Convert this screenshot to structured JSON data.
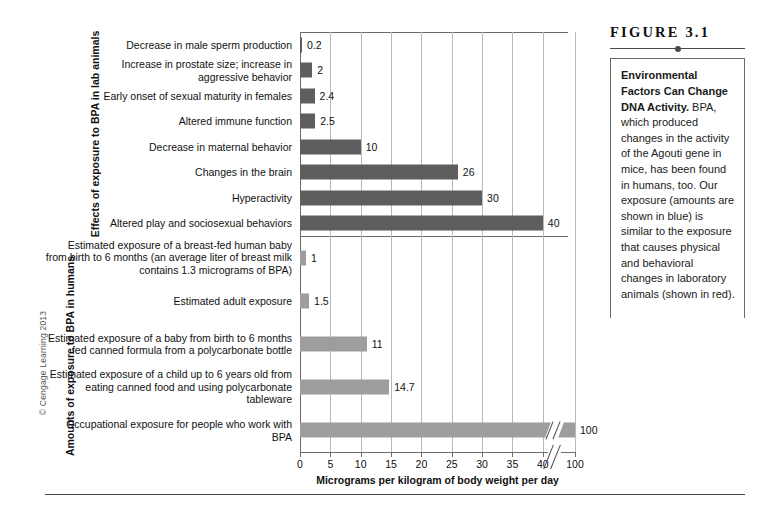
{
  "figure": {
    "number_label": "FIGURE 3.1",
    "caption_bold": "Environmental Factors Can Change DNA Activity.",
    "caption_body": " BPA, which produced changes in the activity of the Agouti gene in mice, has been found in humans, too. Our exposure (amounts are shown in blue) is similar to the exposure that causes physical and behavioral changes in laboratory animals (shown in red).",
    "copyright": "© Cengage Learning 2013"
  },
  "axis": {
    "x_title": "Micrograms per kilogram of body weight per day",
    "tick_labels": [
      "0",
      "5",
      "10",
      "15",
      "20",
      "25",
      "30",
      "35",
      "40",
      "100"
    ],
    "tick_values": [
      0,
      5,
      10,
      15,
      20,
      25,
      30,
      35,
      40,
      100
    ],
    "break_after": 40,
    "group_title_top": "Effects of exposure to BPA in lab animals",
    "group_title_bottom": "Amounts of exposure to BPA in humans"
  },
  "colors": {
    "bar_top": "#5e5e5e",
    "bar_bottom": "#9d9d9d",
    "bar_top_described": "red",
    "bar_bottom_described": "blue",
    "grid": "#b9b9b9",
    "axis": "#6b6b6b"
  },
  "chart_data": {
    "type": "bar",
    "orientation": "horizontal",
    "title": "Environmental Factors Can Change DNA Activity",
    "xlabel": "Micrograms per kilogram of body weight per day",
    "ylabel": "",
    "xlim": [
      0,
      100
    ],
    "axis_break": {
      "from": 42,
      "to": 100,
      "note": "axis broken between 40 and 100"
    },
    "xticks": [
      0,
      5,
      10,
      15,
      20,
      25,
      30,
      35,
      40,
      100
    ],
    "grid": true,
    "legend": "none",
    "series": [
      {
        "name": "Effects of exposure to BPA in lab animals",
        "color": "#5e5e5e",
        "described_color": "red",
        "categories": [
          "Decrease in male sperm production",
          "Increase in prostate size; increase in aggressive behavior",
          "Early onset of sexual maturity in females",
          "Altered immune function",
          "Decrease in maternal behavior",
          "Changes in the brain",
          "Hyperactivity",
          "Altered play and sociosexual behaviors"
        ],
        "values": [
          0.2,
          2,
          2.4,
          2.5,
          10,
          26,
          30,
          40
        ],
        "value_labels": [
          "0.2",
          "2",
          "2.4",
          "2.5",
          "10",
          "26",
          "30",
          "40"
        ]
      },
      {
        "name": "Amounts of exposure to BPA in humans",
        "color": "#9d9d9d",
        "described_color": "blue",
        "categories": [
          "Estimated exposure of a breast-fed human baby from birth to 6 months (an average liter of breast milk contains 1.3 micrograms of BPA)",
          "Estimated adult exposure",
          "Estimated exposure of a baby from birth to 6 months fed canned formula from a polycarbonate bottle",
          "Estimated exposure of a child up to 6 years old from eating canned food and using polycarbonate tableware",
          "Occupational exposure for people who work with BPA"
        ],
        "values": [
          1,
          1.5,
          11,
          14.7,
          100
        ],
        "value_labels": [
          "1",
          "1.5",
          "11",
          "14.7",
          "100"
        ]
      }
    ]
  },
  "rows_top": [
    {
      "label": "Decrease in male sperm production",
      "value": 0.2,
      "value_label": "0.2"
    },
    {
      "label": "Increase in prostate size; increase in aggressive behavior",
      "value": 2,
      "value_label": "2"
    },
    {
      "label": "Early onset of sexual maturity in females",
      "value": 2.4,
      "value_label": "2.4"
    },
    {
      "label": "Altered immune function",
      "value": 2.5,
      "value_label": "2.5"
    },
    {
      "label": "Decrease in maternal behavior",
      "value": 10,
      "value_label": "10"
    },
    {
      "label": "Changes in the brain",
      "value": 26,
      "value_label": "26"
    },
    {
      "label": "Hyperactivity",
      "value": 30,
      "value_label": "30"
    },
    {
      "label": "Altered play and sociosexual behaviors",
      "value": 40,
      "value_label": "40"
    }
  ],
  "rows_bottom": [
    {
      "label": "Estimated exposure of a breast-fed human baby from birth to 6 months (an average liter of breast milk contains 1.3 micrograms of BPA)",
      "value": 1,
      "value_label": "1"
    },
    {
      "label": "Estimated adult exposure",
      "value": 1.5,
      "value_label": "1.5"
    },
    {
      "label": "Estimated exposure of a baby from birth to 6 months fed canned formula from a polycarbonate bottle",
      "value": 11,
      "value_label": "11"
    },
    {
      "label": "Estimated exposure of a child up to 6 years old from eating canned food and using polycarbonate tableware",
      "value": 14.7,
      "value_label": "14.7"
    },
    {
      "label": "Occupational exposure for people who work with BPA",
      "value": 100,
      "value_label": "100"
    }
  ]
}
